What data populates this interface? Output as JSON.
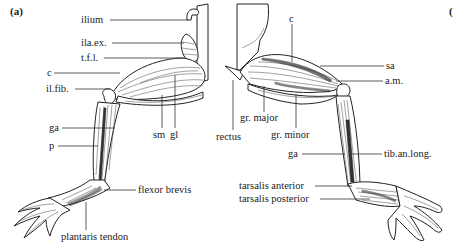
{
  "figure": {
    "panel_a_label": "(a)",
    "panel_b_label_partial": "("
  },
  "left_view": {
    "labels": [
      {
        "id": "ilium",
        "text": "ilium"
      },
      {
        "id": "ila_ex",
        "text": "ila.ex."
      },
      {
        "id": "tfl",
        "text": "t.f.l."
      },
      {
        "id": "c",
        "text": "c"
      },
      {
        "id": "il_fib",
        "text": "il.fib."
      },
      {
        "id": "sm",
        "text": "sm"
      },
      {
        "id": "gl",
        "text": "gl"
      },
      {
        "id": "ga",
        "text": "ga"
      },
      {
        "id": "p",
        "text": "p"
      },
      {
        "id": "flexor_brevis",
        "text": "flexor brevis"
      },
      {
        "id": "plantaris_tendon",
        "text": "plantaris tendon"
      }
    ]
  },
  "right_view": {
    "labels": [
      {
        "id": "c",
        "text": "c"
      },
      {
        "id": "sa",
        "text": "sa"
      },
      {
        "id": "am",
        "text": "a.m."
      },
      {
        "id": "gr_major",
        "text": "gr. major"
      },
      {
        "id": "rectus",
        "text": "rectus"
      },
      {
        "id": "gr_minor",
        "text": "gr. minor"
      },
      {
        "id": "ga",
        "text": "ga"
      },
      {
        "id": "tib_an_long",
        "text": "tib.an.long."
      },
      {
        "id": "tarsalis_anterior",
        "text": "tarsalis anterior"
      },
      {
        "id": "tarsalis_posterior",
        "text": "tarsalis posterior"
      }
    ]
  }
}
